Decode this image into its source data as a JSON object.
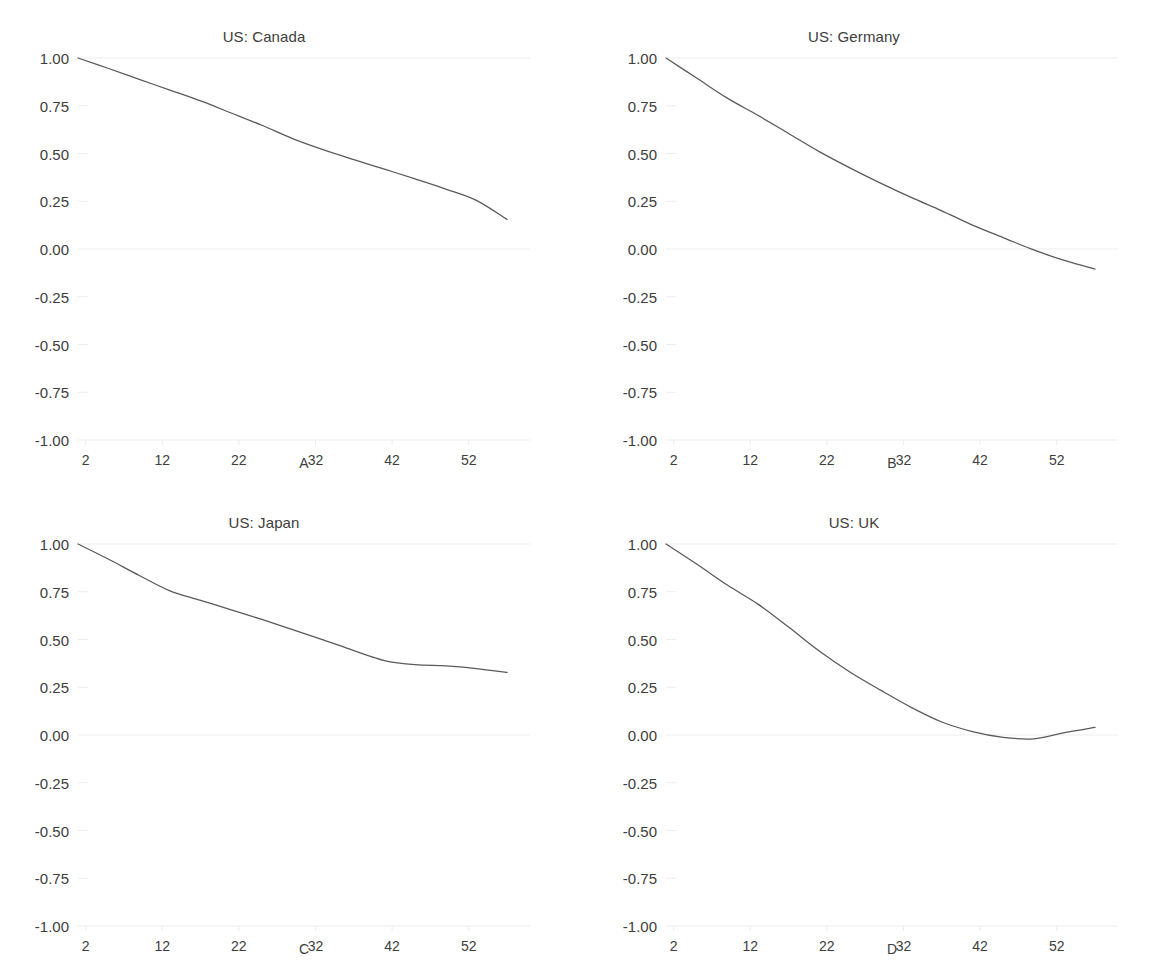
{
  "figure": {
    "background": "#ffffff",
    "line_color": "#5a5a5a",
    "grid_color": "#ededed",
    "text_color": "#3d3d3d"
  },
  "chart_data": [
    {
      "type": "line",
      "title": "US: Canada",
      "panel_label": "A",
      "xlabel": "",
      "ylabel": "",
      "xlim": [
        1,
        60
      ],
      "ylim": [
        -1.0,
        1.0
      ],
      "grid": true,
      "legend": "none",
      "xticks": [
        2,
        12,
        22,
        32,
        42,
        52
      ],
      "xtick_labels": [
        "2",
        "12",
        "22",
        "32",
        "42",
        "52"
      ],
      "yticks": [
        1.0,
        0.75,
        0.5,
        0.25,
        0.0,
        -0.25,
        -0.5,
        -0.75,
        -1.0
      ],
      "ytick_labels": [
        "1.00",
        "0.75",
        "0.50",
        "0.25",
        "0.00",
        "-0.25",
        "-0.50",
        "-0.75",
        "-1.00"
      ],
      "x": [
        1,
        5,
        9,
        13,
        17,
        21,
        25,
        29,
        33,
        37,
        41,
        45,
        49,
        53,
        57
      ],
      "values": [
        1.0,
        0.945,
        0.888,
        0.832,
        0.775,
        0.712,
        0.648,
        0.578,
        0.52,
        0.468,
        0.418,
        0.367,
        0.314,
        0.255,
        0.155
      ]
    },
    {
      "type": "line",
      "title": "US: Germany",
      "panel_label": "B",
      "xlabel": "",
      "ylabel": "",
      "xlim": [
        1,
        60
      ],
      "ylim": [
        -1.0,
        1.0
      ],
      "grid": true,
      "legend": "none",
      "xticks": [
        2,
        12,
        22,
        32,
        42,
        52
      ],
      "xtick_labels": [
        "2",
        "12",
        "22",
        "32",
        "42",
        "52"
      ],
      "yticks": [
        1.0,
        0.75,
        0.5,
        0.25,
        0.0,
        -0.25,
        -0.5,
        -0.75,
        -1.0
      ],
      "ytick_labels": [
        "1.00",
        "0.75",
        "0.50",
        "0.25",
        "0.00",
        "-0.25",
        "-0.50",
        "-0.75",
        "-1.00"
      ],
      "x": [
        1,
        5,
        9,
        13,
        17,
        21,
        25,
        29,
        33,
        37,
        41,
        45,
        49,
        53,
        57
      ],
      "values": [
        1.0,
        0.895,
        0.79,
        0.7,
        0.605,
        0.51,
        0.425,
        0.345,
        0.27,
        0.2,
        0.125,
        0.06,
        -0.005,
        -0.06,
        -0.105
      ]
    },
    {
      "type": "line",
      "title": "US: Japan",
      "panel_label": "C",
      "xlabel": "",
      "ylabel": "",
      "xlim": [
        1,
        60
      ],
      "ylim": [
        -1.0,
        1.0
      ],
      "grid": true,
      "legend": "none",
      "xticks": [
        2,
        12,
        22,
        32,
        42,
        52
      ],
      "xtick_labels": [
        "2",
        "12",
        "22",
        "32",
        "42",
        "52"
      ],
      "yticks": [
        1.0,
        0.75,
        0.5,
        0.25,
        0.0,
        -0.25,
        -0.5,
        -0.75,
        -1.0
      ],
      "ytick_labels": [
        "1.00",
        "0.75",
        "0.50",
        "0.25",
        "0.00",
        "-0.25",
        "-0.50",
        "-0.75",
        "-1.00"
      ],
      "x": [
        1,
        5,
        9,
        13,
        17,
        21,
        25,
        29,
        33,
        37,
        41,
        45,
        49,
        53,
        57
      ],
      "values": [
        1.0,
        0.92,
        0.835,
        0.755,
        0.705,
        0.655,
        0.605,
        0.552,
        0.498,
        0.442,
        0.39,
        0.368,
        0.362,
        0.348,
        0.328
      ]
    },
    {
      "type": "line",
      "title": "US: UK",
      "panel_label": "D",
      "xlabel": "",
      "ylabel": "",
      "xlim": [
        1,
        60
      ],
      "ylim": [
        -1.0,
        1.0
      ],
      "grid": true,
      "legend": "none",
      "xticks": [
        2,
        12,
        22,
        32,
        42,
        52
      ],
      "xtick_labels": [
        "2",
        "12",
        "22",
        "32",
        "42",
        "52"
      ],
      "yticks": [
        1.0,
        0.75,
        0.5,
        0.25,
        0.0,
        -0.25,
        -0.5,
        -0.75,
        -1.0
      ],
      "ytick_labels": [
        "1.00",
        "0.75",
        "0.50",
        "0.25",
        "0.00",
        "-0.25",
        "-0.50",
        "-0.75",
        "-1.00"
      ],
      "x": [
        1,
        5,
        9,
        13,
        17,
        21,
        25,
        29,
        33,
        37,
        41,
        45,
        49,
        53,
        57
      ],
      "values": [
        1.0,
        0.895,
        0.785,
        0.685,
        0.565,
        0.44,
        0.33,
        0.235,
        0.145,
        0.068,
        0.018,
        -0.012,
        -0.02,
        0.012,
        0.04
      ]
    }
  ]
}
